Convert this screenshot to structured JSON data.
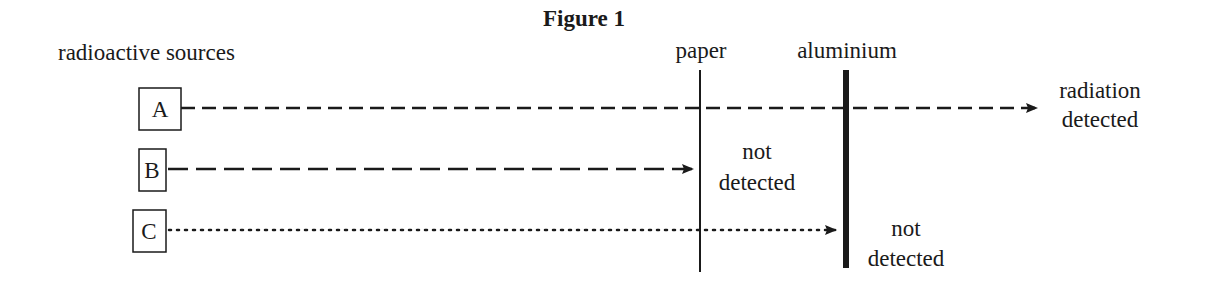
{
  "figure": {
    "title": "Figure 1",
    "sources_label": "radioactive sources",
    "barriers": [
      {
        "id": "paper",
        "label": "paper"
      },
      {
        "id": "aluminium",
        "label": "aluminium"
      }
    ],
    "sources": [
      {
        "id": "A",
        "label": "A",
        "line_style": "short-dashed",
        "stops_at": "none",
        "outcome_line1": "radiation",
        "outcome_line2": "detected"
      },
      {
        "id": "B",
        "label": "B",
        "line_style": "long-dashed",
        "stops_at": "paper",
        "outcome_line1": "not",
        "outcome_line2": "detected"
      },
      {
        "id": "C",
        "label": "C",
        "line_style": "dotted",
        "stops_at": "aluminium",
        "outcome_line1": "not",
        "outcome_line2": "detected"
      }
    ],
    "colors": {
      "ink": "#1a1a1a",
      "background": "#ffffff"
    }
  }
}
